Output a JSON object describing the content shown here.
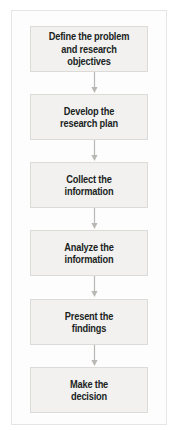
{
  "figure": {
    "type": "flowchart",
    "orientation": "vertical",
    "colors": {
      "page_background": "#ffffff",
      "frame_background": "#fdfdfd",
      "frame_border": "#e6e5e3",
      "box_fill": "#f2f1ef",
      "box_border": "#dddbd8",
      "text": "#201f1e",
      "connector": "#b9b7b4"
    }
  },
  "steps": [
    {
      "index": 1,
      "label": "Define the problem\nand research objectives"
    },
    {
      "index": 2,
      "label": "Develop the\nresearch plan"
    },
    {
      "index": 3,
      "label": "Collect the\ninformation"
    },
    {
      "index": 4,
      "label": "Analyze the\ninformation"
    },
    {
      "index": 5,
      "label": "Present the\nfindings"
    },
    {
      "index": 6,
      "label": "Make the\ndecision"
    }
  ],
  "connectors": [
    {
      "from": 1,
      "to": 2,
      "icon": "down-arrow-icon"
    },
    {
      "from": 2,
      "to": 3,
      "icon": "down-arrow-icon"
    },
    {
      "from": 3,
      "to": 4,
      "icon": "down-arrow-icon"
    },
    {
      "from": 4,
      "to": 5,
      "icon": "down-arrow-icon"
    },
    {
      "from": 5,
      "to": 6,
      "icon": "down-arrow-icon"
    }
  ]
}
